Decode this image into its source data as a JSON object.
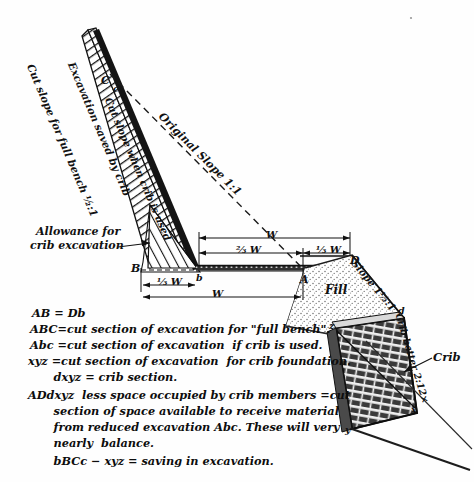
{
  "figure": {
    "type": "engineering-cross-section"
  },
  "diagram_labels": {
    "cut_slope_full_bench": "Cut slope for full bench ½:1",
    "excavation_saved": "Excavation saved by crib",
    "cut_slope_when_crib": "Cut slope when crib is used",
    "original_slope": "Original Slope 1:1",
    "allowance_line1": "Allowance for",
    "allowance_line2": "crib excavation",
    "fill": "Fill",
    "fill_slope": "Slope 1½:1",
    "crib": "Crib",
    "crib_batter": "Crib batter 2:12×"
  },
  "points": {
    "C": "C",
    "c": "c",
    "B": "B",
    "b": "b",
    "A": "A",
    "D": "D",
    "d": "d",
    "x": "x",
    "y": "y",
    "z": "z"
  },
  "dimensions": {
    "top_total": "W",
    "two_thirds": "⅔ W",
    "one_third_right": "⅓ W",
    "one_third_left": "⅓ W",
    "bottom_total": "W"
  },
  "legend": [
    "AB = Db",
    "ABC=cut section of excavation for \"full bench\".",
    "Abc =cut section of excavation  if crib is used.",
    "xyz =cut section of excavation  for crib foundation.",
    "      dxyz = crib section.",
    "ADdxyz  less space occupied by crib members =cut",
    "      section of space available to receive material",
    "      from reduced excavation Abc. These will very",
    "      nearly  balance.",
    "      bBCc − xyz = saving in excavation."
  ],
  "colors": {
    "ink": "#111111",
    "paper": "#fefefe",
    "fill_stipple": "#8c8c8c",
    "crib_timber": "#2a2a2a"
  }
}
